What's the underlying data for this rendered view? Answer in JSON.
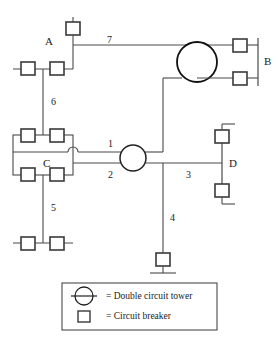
{
  "diagram": {
    "stroke_color": "#4a4a4a",
    "heavy_stroke_color": "#111111",
    "background": "#ffffff",
    "bus_labels": [
      {
        "id": "bus-a",
        "text": "A"
      },
      {
        "id": "bus-b",
        "text": "B"
      },
      {
        "id": "bus-c",
        "text": "C"
      },
      {
        "id": "bus-d",
        "text": "D"
      }
    ],
    "line_labels": [
      {
        "id": "line-1",
        "text": "1"
      },
      {
        "id": "line-2",
        "text": "2"
      },
      {
        "id": "line-3",
        "text": "3"
      },
      {
        "id": "line-4",
        "text": "4"
      },
      {
        "id": "line-5",
        "text": "5"
      },
      {
        "id": "line-6",
        "text": "6"
      },
      {
        "id": "line-7",
        "text": "7"
      }
    ]
  },
  "legend": {
    "items": [
      {
        "symbol": "double-circuit-tower-symbol",
        "text": "= Double circuit tower"
      },
      {
        "symbol": "circuit-breaker-symbol",
        "text": "= Circuit breaker"
      }
    ]
  }
}
